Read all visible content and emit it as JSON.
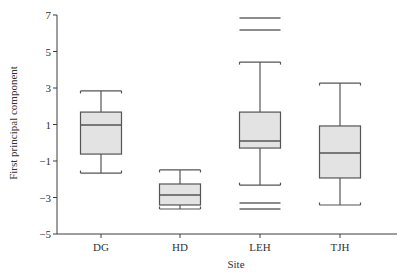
{
  "chart_data": {
    "type": "box",
    "title": "",
    "xlabel": "Site",
    "ylabel": "First principal component",
    "ylim": [
      -5,
      7
    ],
    "yticks": [
      7,
      5,
      3,
      1,
      -1,
      -3,
      -5
    ],
    "ytick_labels": [
      "7",
      "5",
      "3",
      "1",
      "−1",
      "−3",
      "−5"
    ],
    "categories": [
      "DG",
      "HD",
      "LEH",
      "TJH"
    ],
    "grid": false,
    "legend": null,
    "series": [
      {
        "name": "DG",
        "whisker_high": 2.84,
        "q3": 1.68,
        "median": 0.97,
        "q1": -0.62,
        "whisker_low": -1.66,
        "outliers": []
      },
      {
        "name": "HD",
        "whisker_high": -1.49,
        "q3": -2.26,
        "median": -2.86,
        "q1": -3.41,
        "whisker_low": -3.63,
        "outliers": []
      },
      {
        "name": "LEH",
        "whisker_high": 4.42,
        "q3": 1.68,
        "median": 0.1,
        "q1": -0.29,
        "whisker_low": -2.32,
        "outliers": [
          6.84,
          6.18,
          -3.3,
          -3.63
        ]
      },
      {
        "name": "TJH",
        "whisker_high": 3.27,
        "q3": 0.92,
        "median": -0.56,
        "q1": -1.93,
        "whisker_low": -3.41,
        "outliers": []
      }
    ]
  },
  "axes": {
    "x_title": "Site",
    "y_title": "First principal component"
  }
}
